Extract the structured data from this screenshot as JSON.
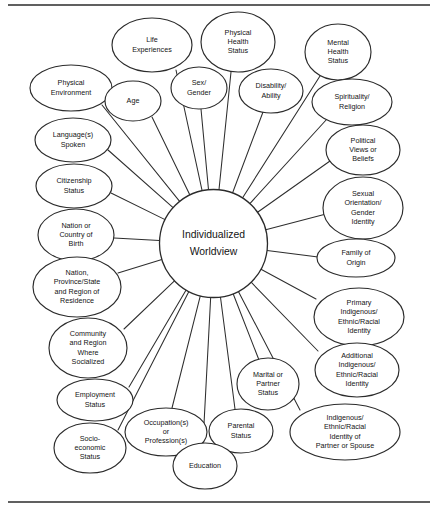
{
  "document": {
    "title": "Individualized Worldview",
    "figure_type": "radial hub-and-spoke concept map",
    "top_rule": "horizontal-rule",
    "bottom_rule": "horizontal-rule"
  },
  "hub": {
    "label": "Individualized Worldview",
    "lines": [
      "Individualized",
      "Worldview"
    ],
    "cx": 213.5,
    "cy": 243.5,
    "r": 54
  },
  "style": {
    "background": "#ffffff",
    "stroke": "#2b2b2b",
    "text": "#141414",
    "node_fill": "#ffffff"
  },
  "nodes": [
    {
      "id": "life-experiences",
      "lines": [
        "Life",
        "Experiences"
      ],
      "cx": 152,
      "cy": 45,
      "rx": 40,
      "ry": 27,
      "anchor_x": 176,
      "anchor_y": 70
    },
    {
      "id": "physical-health-status",
      "lines": [
        "Physical",
        "Health",
        "Status"
      ],
      "cx": 238,
      "cy": 42,
      "rx": 37,
      "ry": 30,
      "anchor_x": 231,
      "anchor_y": 72
    },
    {
      "id": "mental-health-status",
      "lines": [
        "Mental",
        "Health",
        "Status"
      ],
      "cx": 338,
      "cy": 52,
      "rx": 33,
      "ry": 28,
      "anchor_x": 320,
      "anchor_y": 76
    },
    {
      "id": "physical-environment",
      "lines": [
        "Physical",
        "Environment"
      ],
      "cx": 71,
      "cy": 88,
      "rx": 41,
      "ry": 23,
      "anchor_x": 102,
      "anchor_y": 105
    },
    {
      "id": "age",
      "lines": [
        "Age"
      ],
      "cx": 133,
      "cy": 101,
      "rx": 28,
      "ry": 20,
      "anchor_x": 152,
      "anchor_y": 117
    },
    {
      "id": "sex-gender",
      "lines": [
        "Sex/",
        "Gender"
      ],
      "cx": 199,
      "cy": 88,
      "rx": 28,
      "ry": 21,
      "anchor_x": 201,
      "anchor_y": 109
    },
    {
      "id": "disability-ability",
      "lines": [
        "Disability/",
        "Ability"
      ],
      "cx": 271,
      "cy": 91,
      "rx": 32,
      "ry": 22,
      "anchor_x": 263,
      "anchor_y": 112
    },
    {
      "id": "spirituality-religion",
      "lines": [
        "Spirituality/",
        "Religion"
      ],
      "cx": 352,
      "cy": 102,
      "rx": 40,
      "ry": 23,
      "anchor_x": 327,
      "anchor_y": 119
    },
    {
      "id": "languages-spoken",
      "lines": [
        "Language(s)",
        "Spoken"
      ],
      "cx": 73,
      "cy": 140,
      "rx": 38,
      "ry": 22,
      "anchor_x": 108,
      "anchor_y": 150
    },
    {
      "id": "political-views-or-beliefs",
      "lines": [
        "Political",
        "Views or",
        "Beliefs"
      ],
      "cx": 363,
      "cy": 150,
      "rx": 37,
      "ry": 25,
      "anchor_x": 330,
      "anchor_y": 161
    },
    {
      "id": "citizenship-status",
      "lines": [
        "Citizenship",
        "Status"
      ],
      "cx": 74,
      "cy": 186,
      "rx": 38,
      "ry": 22,
      "anchor_x": 111,
      "anchor_y": 193
    },
    {
      "id": "sexual-orientation-gender-identity",
      "lines": [
        "Sexual",
        "Orientation/",
        "Gender",
        "Identity"
      ],
      "cx": 363,
      "cy": 208,
      "rx": 40,
      "ry": 31,
      "anchor_x": 326,
      "anchor_y": 214
    },
    {
      "id": "nation-or-country-of-birth",
      "lines": [
        "Nation or",
        "Country of",
        "Birth"
      ],
      "cx": 76,
      "cy": 235,
      "rx": 38,
      "ry": 26,
      "anchor_x": 114,
      "anchor_y": 238
    },
    {
      "id": "family-of-origin",
      "lines": [
        "Family of",
        "Origin"
      ],
      "cx": 356,
      "cy": 258,
      "rx": 39,
      "ry": 19,
      "anchor_x": 318,
      "anchor_y": 257
    },
    {
      "id": "nation-province-state-region-of-residence",
      "lines": [
        "Nation,",
        "Province/State",
        "and Region of",
        "Residence"
      ],
      "cx": 77,
      "cy": 287,
      "rx": 44,
      "ry": 30,
      "anchor_x": 118,
      "anchor_y": 273
    },
    {
      "id": "primary-indigenous-ethnic-racial-identity",
      "lines": [
        "Primary",
        "Indigenous/",
        "Ethnic/Racial",
        "Identity"
      ],
      "cx": 359,
      "cy": 317,
      "rx": 45,
      "ry": 29,
      "anchor_x": 316,
      "anchor_y": 299
    },
    {
      "id": "community-and-region-where-socialized",
      "lines": [
        "Community",
        "and Region",
        "Where",
        "Socialized"
      ],
      "cx": 88,
      "cy": 348,
      "rx": 39,
      "ry": 30,
      "anchor_x": 124,
      "anchor_y": 329
    },
    {
      "id": "additional-indigenous-ethnic-racial-identity",
      "lines": [
        "Additional",
        "Indigenous/",
        "Ethnic/Racial",
        "Identity"
      ],
      "cx": 357,
      "cy": 370,
      "rx": 42,
      "ry": 27,
      "anchor_x": 318,
      "anchor_y": 351
    },
    {
      "id": "employment-status",
      "lines": [
        "Employment",
        "Status"
      ],
      "cx": 95,
      "cy": 400,
      "rx": 38,
      "ry": 21,
      "anchor_x": 129,
      "anchor_y": 387
    },
    {
      "id": "marital-or-partner-status",
      "lines": [
        "Marital or",
        "Partner",
        "Status"
      ],
      "cx": 268,
      "cy": 384,
      "rx": 31,
      "ry": 26,
      "anchor_x": 259,
      "anchor_y": 360
    },
    {
      "id": "socio-economic-status",
      "lines": [
        "Socio-",
        "economic",
        "Status"
      ],
      "cx": 90,
      "cy": 448,
      "rx": 36,
      "ry": 25,
      "anchor_x": 118,
      "anchor_y": 430
    },
    {
      "id": "occupations-or-professions",
      "lines": [
        "Occupation(s)",
        "or",
        "Profession(s)"
      ],
      "cx": 166,
      "cy": 432,
      "rx": 41,
      "ry": 24,
      "anchor_x": 172,
      "anchor_y": 408
    },
    {
      "id": "parental-status",
      "lines": [
        "Parental",
        "Status"
      ],
      "cx": 241,
      "cy": 431,
      "rx": 32,
      "ry": 22,
      "anchor_x": 235,
      "anchor_y": 409
    },
    {
      "id": "education",
      "lines": [
        "Education"
      ],
      "cx": 205,
      "cy": 466,
      "rx": 32,
      "ry": 23,
      "anchor_x": 203,
      "anchor_y": 443
    },
    {
      "id": "indigenous-ethnic-racial-identity-of-partner-or-spouse",
      "lines": [
        "Indigenous/",
        "Ethnic/Racial",
        "Identity of",
        "Partner or Spouse"
      ],
      "cx": 345,
      "cy": 432,
      "rx": 55,
      "ry": 28,
      "anchor_x": 300,
      "anchor_y": 410
    }
  ],
  "rules": [
    {
      "id": "top-rule",
      "x1": 8,
      "y1": 5,
      "x2": 430,
      "y2": 5
    },
    {
      "id": "bottom-rule",
      "x1": 8,
      "y1": 502,
      "x2": 430,
      "y2": 502
    }
  ]
}
